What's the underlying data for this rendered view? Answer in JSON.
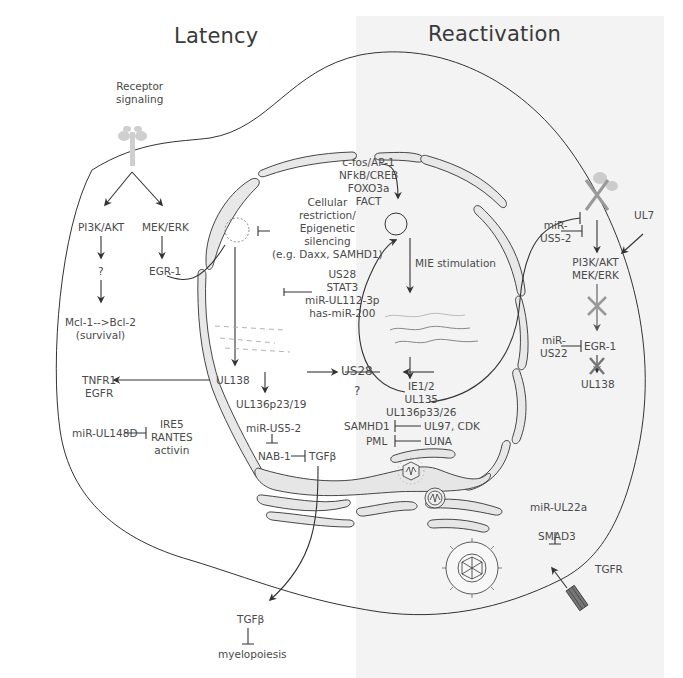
{
  "panels": {
    "left_title": "Latency",
    "right_title": "Reactivation",
    "right_bg": "#f3f3f3"
  },
  "latency": {
    "receptor": [
      "Receptor",
      "signaling"
    ],
    "pi3k": "PI3K/AKT",
    "mekerk": "MEK/ERK",
    "question": "?",
    "egr1": "EGR-1",
    "mcl": [
      "Mcl-1-->Bcl-2",
      "(survival)"
    ],
    "restriction": [
      "Cellular",
      "restriction/",
      "Epigenetic",
      "silencing",
      "(e.g. Daxx, SAMHD1)"
    ],
    "us28_stat3": [
      "US28",
      "STAT3",
      "miR-UL112-3p",
      "has-miR-200"
    ],
    "ul138": "UL138",
    "tnfr": [
      "TNFR1",
      "EGFR"
    ],
    "ul136": "UL136p23/19",
    "mir_ul148d": "miR-UL148D",
    "ire5": [
      "IRE5",
      "RANTES",
      "activin"
    ],
    "mir_us5_2": "miR-US5-2",
    "nab1": "NAB-1",
    "tgfb": "TGFβ",
    "tgfb_out": "TGFβ",
    "myelopoiesis": "myelopoiesis"
  },
  "center": {
    "us28": "US28",
    "question": "?"
  },
  "reactivation": {
    "factors": [
      "c-fos/AP-1",
      "NFkB/CREB",
      "FOXO3a",
      "FACT"
    ],
    "mie": "MIE stimulation",
    "ie": [
      "IE1/2",
      "UL135",
      "UL136p33/26"
    ],
    "samhd1": "SAMHD1",
    "ul97": "UL97, CDK",
    "pml": "PML",
    "luna": "LUNA",
    "mir_us5_2": [
      "miR-",
      "US5-2"
    ],
    "ul7": "UL7",
    "pi3k_mek": [
      "PI3K/AKT",
      "MEK/ERK"
    ],
    "mir_us22": [
      "miR-",
      "US22"
    ],
    "egr1": "EGR-1",
    "ul138": "UL138",
    "mir_ul22a": "miR-UL22a",
    "smad3": "SMAD3",
    "tgfr": "TGFR"
  },
  "colors": {
    "line": "#333333",
    "membrane_fill": "#e6e6e6",
    "grey_glyph": "#aaaaaa"
  }
}
